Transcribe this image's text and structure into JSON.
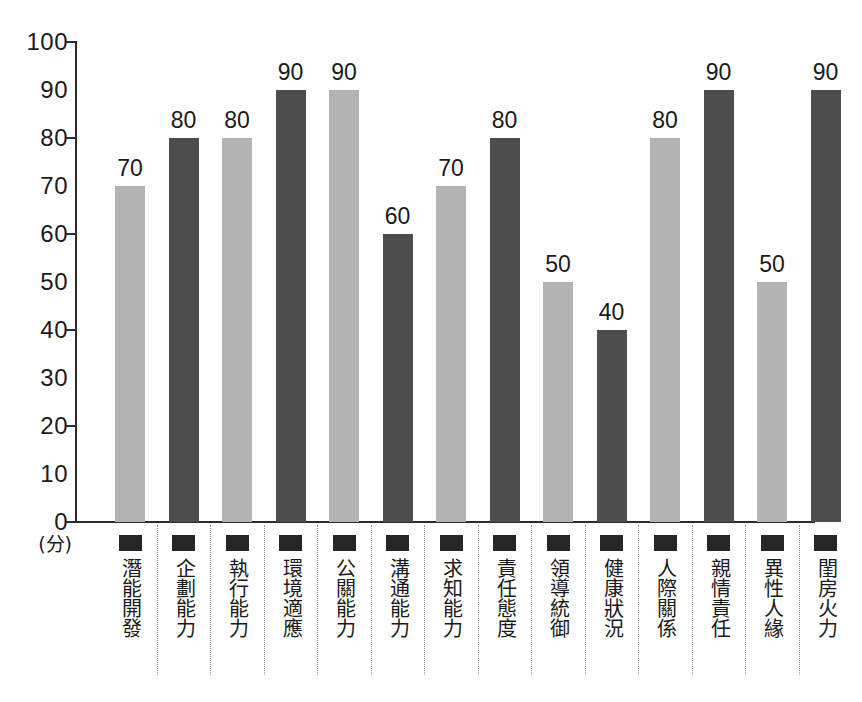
{
  "chart_data": {
    "type": "bar",
    "title": "",
    "xlabel": "",
    "ylabel": "(分)",
    "ylim": [
      0,
      100
    ],
    "grid": false,
    "legend": "none",
    "y_ticks": [
      100,
      90,
      80,
      70,
      60,
      50,
      40,
      30,
      20,
      10,
      0
    ],
    "y_major_ticks": [
      100,
      80,
      60,
      40,
      20,
      0
    ],
    "categories": [
      "潛能開發",
      "企劃能力",
      "執行能力",
      "環境適應",
      "公關能力",
      "溝通能力",
      "求知能力",
      "責任態度",
      "領導統御",
      "健康狀況",
      "人際關係",
      "親情責任",
      "異性人緣",
      "閨房火力"
    ],
    "values": [
      70,
      80,
      80,
      90,
      90,
      60,
      70,
      80,
      50,
      40,
      80,
      90,
      50,
      90
    ],
    "bar_styles": [
      "light",
      "dark",
      "light",
      "dark",
      "light",
      "dark",
      "light",
      "dark",
      "light",
      "dark",
      "light",
      "dark",
      "light",
      "dark"
    ],
    "colors": {
      "light_bar": "#b3b3b3",
      "dark_bar": "#4d4d4d",
      "axis": "#2b2b2b",
      "text": "#1a1a1a",
      "marker": "#262626",
      "divider": "#9a9a9a",
      "background": "#ffffff"
    },
    "category_marker": "filled-square-marker"
  }
}
